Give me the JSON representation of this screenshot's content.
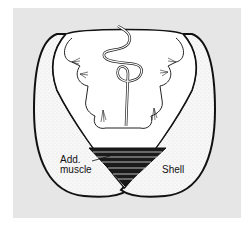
{
  "figure": {
    "labels": {
      "adductor_line1": "Add.",
      "adductor_line2": "muscle",
      "shell": "Shell"
    },
    "colors": {
      "background": "#ffffff",
      "panel": "#e6e6e6",
      "shell_fill": "#f7f7f7",
      "ink": "#111111",
      "muscle": "#1a1a1a"
    }
  }
}
